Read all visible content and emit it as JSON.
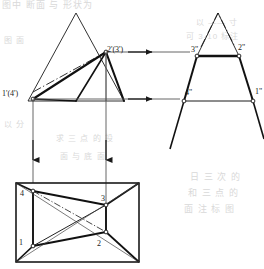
{
  "figure": {
    "background_text": {
      "top_line": "图中 断面 与 形状为",
      "right_a": "以 —— 寸",
      "right_b": "可 3-10 标注",
      "right_c": "日 三 次 的",
      "right_d": "和 三 点 的",
      "right_e": "面 注 标 图",
      "mid_a": "求 三 点 的 投",
      "mid_b": "面 与 底 面",
      "left_a": "图 面",
      "left_b": "以 分"
    },
    "views": {
      "front": {
        "name": "front-view",
        "labels": [
          {
            "id": "v23-front",
            "text": "2'(3')",
            "x": 107,
            "y": 52
          },
          {
            "id": "v14-front",
            "text": "1'(4')",
            "x": 2,
            "y": 96
          }
        ]
      },
      "side": {
        "name": "side-view",
        "labels": [
          {
            "id": "v3-side",
            "text": "3\"",
            "x": 191,
            "y": 52
          },
          {
            "id": "v2-side",
            "text": "2\"",
            "x": 238,
            "y": 50
          },
          {
            "id": "v4-side",
            "text": "4\"",
            "x": 185,
            "y": 95
          },
          {
            "id": "v1-side",
            "text": "1\"",
            "x": 255,
            "y": 94
          }
        ]
      },
      "top": {
        "name": "top-view",
        "labels": [
          {
            "id": "v4-top",
            "text": "4",
            "x": 20,
            "y": 196
          },
          {
            "id": "v3-top",
            "text": "3",
            "x": 101,
            "y": 196
          },
          {
            "id": "v1-top",
            "text": "1",
            "x": 19,
            "y": 248
          },
          {
            "id": "v2-top",
            "text": "2",
            "x": 97,
            "y": 250
          }
        ]
      }
    },
    "colors": {
      "stroke": "#1a1a1a",
      "thin": "#555555",
      "dash_dot": "#333333",
      "background": "#ffffff",
      "ghost": "#d9d9d9"
    },
    "annotations": {
      "projector_arrows": [
        {
          "id": "arrow-h-upper",
          "direction": "right",
          "from_label": "2'(3')",
          "to_label": "3\""
        },
        {
          "id": "arrow-h-lower",
          "direction": "right",
          "from_label": "1'(4')",
          "to_label": "4\""
        },
        {
          "id": "arrow-v-left",
          "direction": "down",
          "from_label": "1'(4')",
          "to_label": "4"
        },
        {
          "id": "arrow-v-right",
          "direction": "down",
          "from_label": "2'(3')",
          "to_label": "3"
        }
      ]
    }
  }
}
